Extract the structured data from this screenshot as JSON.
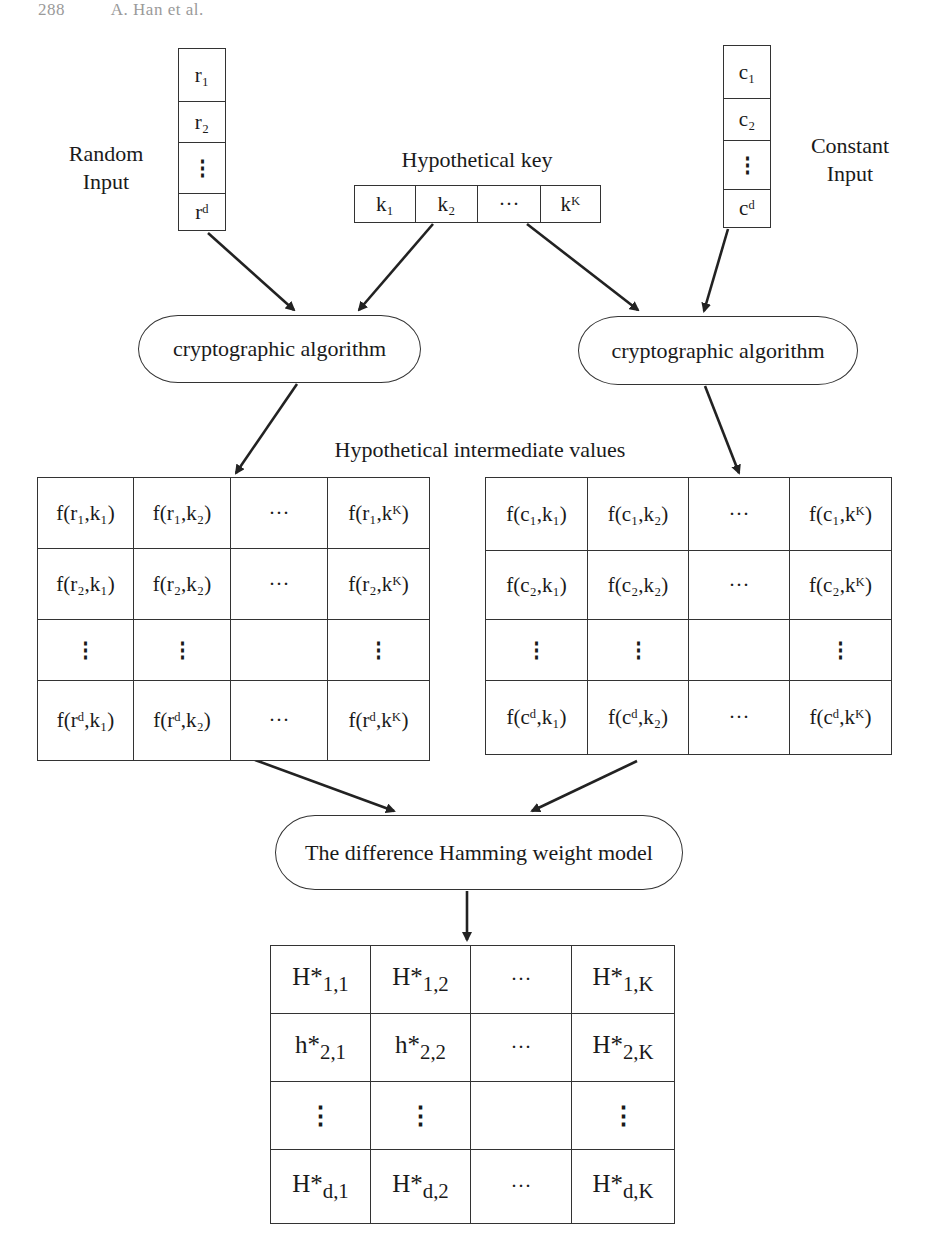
{
  "header": {
    "page_number": "288",
    "running_head": "A. Han et al."
  },
  "random_input": {
    "label_line1": "Random",
    "label_line2": "Input",
    "cells": [
      "r₁",
      "r₂",
      "⋮",
      "rᵈ"
    ]
  },
  "constant_input": {
    "label_line1": "Constant",
    "label_line2": "Input",
    "cells": [
      "c₁",
      "c₂",
      "⋮",
      "cᵈ"
    ]
  },
  "hypothetical_key": {
    "label": "Hypothetical key",
    "cells": [
      "k₁",
      "k₂",
      "···",
      "kᴷ"
    ]
  },
  "crypto_left": {
    "label": "cryptographic algorithm"
  },
  "crypto_right": {
    "label": "cryptographic algorithm"
  },
  "intermediate_label": "Hypothetical intermediate values",
  "matrix_random": {
    "rows": [
      [
        "f(r₁,k₁)",
        "f(r₁,k₂)",
        "···",
        "f(r₁,kᴷ)"
      ],
      [
        "f(r₂,k₁)",
        "f(r₂,k₂)",
        "···",
        "f(r₂,kᴷ)"
      ],
      [
        "⋮",
        "⋮",
        "",
        "⋮"
      ],
      [
        "f(rᵈ,k₁)",
        "f(rᵈ,k₂)",
        "···",
        "f(rᵈ,kᴷ)"
      ]
    ]
  },
  "matrix_constant": {
    "rows": [
      [
        "f(c₁,k₁)",
        "f(c₁,k₂)",
        "···",
        "f(c₁,kᴷ)"
      ],
      [
        "f(c₂,k₁)",
        "f(c₂,k₂)",
        "···",
        "f(c₂,kᴷ)"
      ],
      [
        "⋮",
        "⋮",
        "",
        "⋮"
      ],
      [
        "f(cᵈ,k₁)",
        "f(cᵈ,k₂)",
        "···",
        "f(cᵈ,kᴷ)"
      ]
    ]
  },
  "hamming_model": {
    "label": "The difference Hamming weight model"
  },
  "matrix_hamming": {
    "rows": [
      [
        {
          "base": "H*",
          "sub": "1,1"
        },
        {
          "base": "H*",
          "sub": "1,2"
        },
        {
          "base": "···",
          "sub": ""
        },
        {
          "base": "H*",
          "sub": "1,K"
        }
      ],
      [
        {
          "base": "h*",
          "sub": "2,1"
        },
        {
          "base": "h*",
          "sub": "2,2"
        },
        {
          "base": "···",
          "sub": ""
        },
        {
          "base": "H*",
          "sub": "2,K"
        }
      ],
      [
        {
          "base": "⋮",
          "sub": ""
        },
        {
          "base": "⋮",
          "sub": ""
        },
        {
          "base": "",
          "sub": ""
        },
        {
          "base": "⋮",
          "sub": ""
        }
      ],
      [
        {
          "base": "H*",
          "sub": "d,1"
        },
        {
          "base": "H*",
          "sub": "d,2"
        },
        {
          "base": "···",
          "sub": ""
        },
        {
          "base": "H*",
          "sub": "d,K"
        }
      ]
    ]
  },
  "colors": {
    "stroke": "#333333",
    "text": "#1a1a1a",
    "background": "#ffffff",
    "header_text": "#9a9a9a"
  }
}
